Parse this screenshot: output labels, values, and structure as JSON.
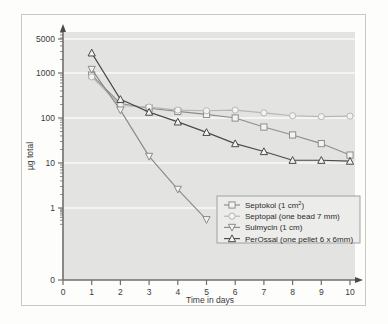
{
  "chart_data": {
    "type": "line",
    "title": "",
    "xlabel": "Time in days",
    "ylabel": "µg total",
    "x": [
      1,
      2,
      3,
      4,
      5,
      6,
      7,
      8,
      9,
      10
    ],
    "xlim": [
      0,
      10
    ],
    "ylim": [
      0,
      5000
    ],
    "yscale": "log",
    "y_tick_labels": [
      "0",
      "1",
      "10",
      "100",
      "1000",
      "5000"
    ],
    "x_tick_labels": [
      "0",
      "1",
      "2",
      "3",
      "4",
      "5",
      "6",
      "7",
      "8",
      "9",
      "10"
    ],
    "grid": true,
    "legend_position": "lower-right",
    "series": [
      {
        "name": "Septokol (1 cm²)",
        "label_main": "Septokol  (1 cm",
        "label_sup": "2",
        "label_tail": ")",
        "marker": "square",
        "color": "#8e8e8a",
        "values": [
          900,
          210,
          165,
          140,
          120,
          100,
          63,
          42,
          27,
          15
        ]
      },
      {
        "name": "Septopal (one bead 7 mm)",
        "label_main": "Septopal (one bead 7 mm)",
        "label_sup": "",
        "label_tail": "",
        "marker": "circle",
        "color": "#b6b6b2",
        "values": [
          820,
          190,
          175,
          150,
          145,
          150,
          130,
          112,
          107,
          110
        ]
      },
      {
        "name": "Sulmycin (1 cm)",
        "label_main": "Sulmycin (1 cm)",
        "label_sup": "",
        "label_tail": "",
        "marker": "triangle-down",
        "color": "#8a8a86",
        "values": [
          1200,
          150,
          14,
          2.6,
          0.55,
          null,
          null,
          null,
          null,
          null
        ]
      },
      {
        "name": "PerOssal (one pellet 6 x 6mm)",
        "label_main": "PerOssal (one pellet 6 x 6mm)",
        "label_sup": "",
        "label_tail": "",
        "marker": "triangle-up",
        "color": "#4a4a48",
        "values": [
          2800,
          260,
          135,
          82,
          48,
          27,
          18,
          11.5,
          11.5,
          11
        ]
      }
    ],
    "colors": {
      "plot_background": "#e3e3e1",
      "gridline": "#f4f4f3",
      "axis": "#6f6f6c",
      "text": "#3a3a38",
      "legend_background": "#ececeb",
      "legend_border": "#9a9a96",
      "figure_border": "#c9c9c4"
    }
  }
}
